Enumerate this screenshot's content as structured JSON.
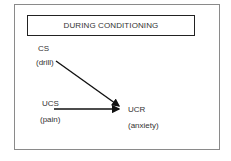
{
  "diagram": {
    "title": "DURING CONDITIONING",
    "nodes": {
      "cs": {
        "abbr": "CS",
        "desc": "(drill)"
      },
      "ucs": {
        "abbr": "UCS",
        "desc": "(pain)"
      },
      "ucr": {
        "abbr": "UCR",
        "desc": "(anxiety)"
      }
    },
    "edges": [
      {
        "from": "CS",
        "to": "UCR",
        "style": "diagonal-arrow"
      },
      {
        "from": "UCS",
        "to": "UCR",
        "style": "horizontal-arrow"
      }
    ],
    "colors": {
      "border": "#8a8a8a",
      "title_border": "#222222",
      "arrow": "#111111",
      "text": "#333333"
    }
  }
}
